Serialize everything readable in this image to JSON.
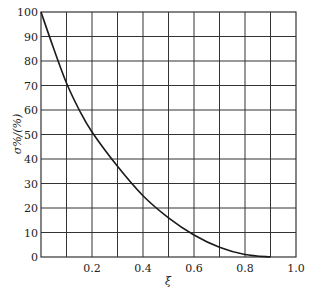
{
  "chart_data": {
    "type": "line",
    "title": "",
    "xlabel": "ξ",
    "ylabel": "σ%/(%)",
    "xlim": [
      0,
      1.0
    ],
    "ylim": [
      0,
      100
    ],
    "grid": true,
    "x_ticks": [
      "0.2",
      "0.4",
      "0.6",
      "0.8",
      "1.0"
    ],
    "y_ticks": [
      "0",
      "10",
      "20",
      "30",
      "40",
      "50",
      "60",
      "70",
      "80",
      "90",
      "100"
    ],
    "series": [
      {
        "name": "σ%",
        "x": [
          0.0,
          0.05,
          0.1,
          0.15,
          0.2,
          0.3,
          0.4,
          0.5,
          0.6,
          0.7,
          0.8,
          0.9
        ],
        "values": [
          100,
          85,
          71,
          60,
          51,
          37,
          25,
          16,
          9,
          4,
          1,
          0
        ]
      }
    ],
    "line_color": "#1a1a1a",
    "grid_color": "#333333"
  }
}
